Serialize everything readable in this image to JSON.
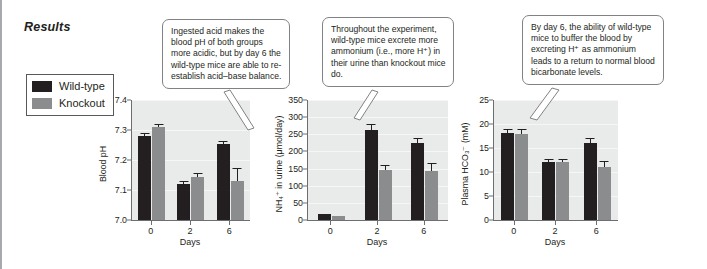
{
  "figure": {
    "section_title": "Results",
    "legend": {
      "items": [
        {
          "label": "Wild-type",
          "color": "#231f20",
          "icon": "legend-swatch"
        },
        {
          "label": "Knockout",
          "color": "#8a8c8e",
          "icon": "legend-swatch"
        }
      ]
    },
    "callouts": [
      {
        "id": "callout-blood-ph",
        "text": "Ingested acid makes the blood pH of both groups more acidic, but by day 6 the wild-type mice are able to re-establish acid–base balance."
      },
      {
        "id": "callout-ammonium",
        "text": "Throughout the experiment, wild-type mice excrete more ammonium (i.e., more H⁺) in their urine than knockout mice do."
      },
      {
        "id": "callout-bicarbonate",
        "text": "By day 6, the ability of wild-type mice to buffer the blood by excreting H⁺ as ammonium leads to a return to normal blood bicarbonate levels."
      }
    ]
  },
  "chart_data": [
    {
      "type": "bar",
      "id": "blood-ph",
      "title": "",
      "xlabel": "Days",
      "ylabel": "Blood pH",
      "categories": [
        "0",
        "2",
        "6"
      ],
      "ylim": [
        7.0,
        7.4
      ],
      "yticks": [
        "7.0",
        "7.1",
        "7.2",
        "7.3",
        "7.4"
      ],
      "ytick_values": [
        7.0,
        7.1,
        7.2,
        7.3,
        7.4
      ],
      "grid": true,
      "legend_position": "external-left",
      "series": [
        {
          "name": "Wild-type",
          "color": "#231f20",
          "values": [
            7.281,
            7.121,
            7.252
          ],
          "errors": [
            0.008,
            0.008,
            0.012
          ]
        },
        {
          "name": "Knockout",
          "color": "#8a8c8e",
          "values": [
            7.311,
            7.142,
            7.131
          ],
          "errors": [
            0.009,
            0.014,
            0.041
          ]
        }
      ]
    },
    {
      "type": "bar",
      "id": "urine-ammonium",
      "title": "",
      "xlabel": "Days",
      "ylabel": "NH₄⁺ in urine (μmol/day)",
      "categories": [
        "0",
        "2",
        "6"
      ],
      "ylim": [
        0,
        350
      ],
      "yticks": [
        "0",
        "50",
        "100",
        "150",
        "200",
        "250",
        "300",
        "350"
      ],
      "ytick_values": [
        0,
        50,
        100,
        150,
        200,
        250,
        300,
        350
      ],
      "grid": true,
      "legend_position": "external-left",
      "series": [
        {
          "name": "Wild-type",
          "color": "#231f20",
          "values": [
            18,
            264,
            224
          ],
          "errors": [
            0,
            16,
            15
          ]
        },
        {
          "name": "Knockout",
          "color": "#8a8c8e",
          "values": [
            13,
            147,
            144
          ],
          "errors": [
            0,
            13,
            22
          ]
        }
      ]
    },
    {
      "type": "bar",
      "id": "plasma-bicarbonate",
      "title": "",
      "xlabel": "Days",
      "ylabel": "Plasma HCO₃⁻ (mM)",
      "categories": [
        "0",
        "2",
        "6"
      ],
      "ylim": [
        0,
        25
      ],
      "yticks": [
        "0",
        "5",
        "10",
        "15",
        "20",
        "25"
      ],
      "ytick_values": [
        0,
        5,
        10,
        15,
        20,
        25
      ],
      "grid": true,
      "legend_position": "external-left",
      "series": [
        {
          "name": "Wild-type",
          "color": "#231f20",
          "values": [
            18.1,
            12.0,
            16.1
          ],
          "errors": [
            0.9,
            0.8,
            1.0
          ]
        },
        {
          "name": "Knockout",
          "color": "#8a8c8e",
          "values": [
            18.0,
            12.0,
            11.0
          ],
          "errors": [
            0.9,
            0.8,
            1.3
          ]
        }
      ]
    }
  ]
}
